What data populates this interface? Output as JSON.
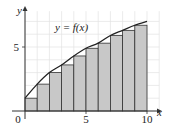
{
  "chart_data": {
    "type": "bar",
    "subtype": "riemann-sum-left-endpoints",
    "title": "",
    "xlabel": "x",
    "ylabel": "y",
    "curve_label": "y = f(x)",
    "xlim": [
      0,
      10
    ],
    "ylim": [
      0,
      7.5
    ],
    "x_ticks": [
      {
        "value": 0,
        "label": "0"
      },
      {
        "value": 5,
        "label": "5"
      },
      {
        "value": 10,
        "label": "10"
      }
    ],
    "y_ticks": [
      {
        "value": 5,
        "label": "5"
      }
    ],
    "grid": true,
    "grid_step": 1,
    "categories": [
      "[0,1]",
      "[1,2]",
      "[2,3]",
      "[3,4]",
      "[4,5]",
      "[5,6]",
      "[6,7]",
      "[7,8]",
      "[8,9]",
      "[9,10]"
    ],
    "bar_lefts": [
      0,
      1,
      2,
      3,
      4,
      5,
      6,
      7,
      8,
      9
    ],
    "bar_width": 1,
    "values": [
      1.0,
      2.1,
      3.0,
      3.6,
      4.3,
      4.9,
      5.3,
      5.9,
      6.3,
      6.7
    ],
    "curve": {
      "x": [
        0,
        1,
        2,
        3,
        4,
        5,
        6,
        7,
        8,
        9,
        10
      ],
      "y": [
        1.0,
        2.1,
        3.0,
        3.6,
        4.3,
        4.9,
        5.3,
        5.9,
        6.3,
        6.7,
        7.0
      ]
    },
    "colors": {
      "bar_fill": "#c8c8c8",
      "bar_stroke": "#333333",
      "curve": "#222222",
      "grid": "#e2e2e2",
      "axis": "#333333"
    }
  }
}
